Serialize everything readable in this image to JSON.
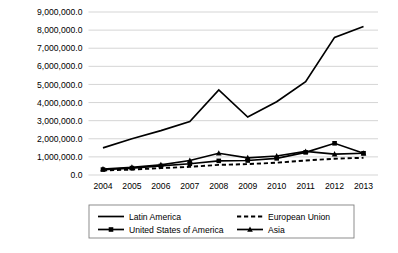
{
  "chart_data": {
    "type": "line",
    "title": "",
    "subtitle": "",
    "xlabel": "",
    "ylabel": "",
    "categories": [
      "2004",
      "2005",
      "2006",
      "2007",
      "2008",
      "2009",
      "2010",
      "2011",
      "2012",
      "2013"
    ],
    "x": [
      2004,
      2005,
      2006,
      2007,
      2008,
      2009,
      2010,
      2011,
      2012,
      2013
    ],
    "ylim": [
      0,
      9000000
    ],
    "ytick_values": [
      0,
      1000000,
      2000000,
      3000000,
      4000000,
      5000000,
      6000000,
      7000000,
      8000000,
      9000000
    ],
    "ytick_labels": [
      "0.0",
      "1,000,000.0",
      "2,000,000.0",
      "3,000,000.0",
      "4,000,000.0",
      "5,000,000.0",
      "6,000,000.0",
      "7,000,000.0",
      "8,000,000.0",
      "9,000,000.0"
    ],
    "xtick_labels": [
      "2004",
      "2005",
      "2006",
      "2007",
      "2008",
      "2009",
      "2010",
      "2011",
      "2012",
      "2013"
    ],
    "grid": true,
    "grid_axis": "y",
    "legend_position": "bottom",
    "series": [
      {
        "name": "Latin America",
        "style": "solid",
        "marker": "none",
        "color": "#000000",
        "values": [
          1500000,
          2000000,
          2450000,
          2950000,
          4700000,
          3200000,
          4050000,
          5150000,
          7600000,
          8200000
        ]
      },
      {
        "name": "United States of America",
        "style": "solid",
        "marker": "square",
        "color": "#000000",
        "values": [
          300000,
          380000,
          500000,
          620000,
          780000,
          800000,
          920000,
          1250000,
          1750000,
          1200000
        ]
      },
      {
        "name": "European Union",
        "style": "dashed",
        "marker": "none",
        "color": "#000000",
        "values": [
          250000,
          300000,
          380000,
          450000,
          560000,
          600000,
          680000,
          800000,
          900000,
          950000
        ]
      },
      {
        "name": "Asia",
        "style": "solid",
        "marker": "triangle",
        "color": "#000000",
        "values": [
          330000,
          420000,
          560000,
          800000,
          1200000,
          950000,
          1050000,
          1300000,
          1150000,
          1200000
        ]
      }
    ],
    "legend_entries": [
      {
        "label": "Latin America",
        "style": "solid",
        "marker": "none"
      },
      {
        "label": "European Union",
        "style": "dashed",
        "marker": "none"
      },
      {
        "label": "United States of America",
        "style": "solid",
        "marker": "square"
      },
      {
        "label": "Asia",
        "style": "solid",
        "marker": "triangle"
      }
    ],
    "colors": {
      "background": "#ffffff",
      "gridline": "#d0d0d0",
      "series": "#000000",
      "legend_border": "#808080",
      "text": "#000000"
    }
  }
}
